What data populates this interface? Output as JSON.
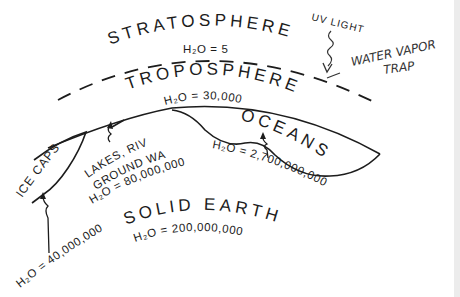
{
  "diagram": {
    "layers": {
      "stratosphere": {
        "name": "STRATOSPHERE",
        "water": "H₂O = 5"
      },
      "troposphere": {
        "name": "TROPOSPHERE",
        "water": "H₂O = 30,000"
      },
      "solid_earth": {
        "name": "SOLID EARTH",
        "water": "H₂O = 200,000,000"
      }
    },
    "reservoirs": {
      "oceans": {
        "name": "OCEANS",
        "water": "H₂O = 2,700,000,000"
      },
      "lakes": {
        "line1": "LAKES, RIVERS,",
        "line2": "GROUND WATER...",
        "water": "H₂O = 80,000,000"
      },
      "ice_caps": {
        "name": "ICE CAPS",
        "water": "H₂O = 40,000,000"
      }
    },
    "annotations": {
      "uv_light": "UV LIGHT",
      "trap_line1": "WATER VAPOR",
      "trap_line2": "TRAP"
    },
    "colors": {
      "ink": "#1c1c1c",
      "background": "#ffffff"
    }
  }
}
